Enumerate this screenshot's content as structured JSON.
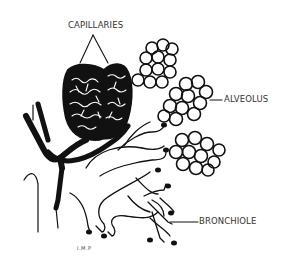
{
  "diagram": {
    "style": "black ink line illustration",
    "labels": {
      "capillaries": "CAPILLARIES",
      "alveolus": "ALVEOLUS",
      "bronchiole": "BRONCHIOLE"
    },
    "signature": "I.M.P",
    "colors": {
      "ink": "#111111",
      "label_text": "#333333",
      "background": "#ffffff"
    }
  }
}
